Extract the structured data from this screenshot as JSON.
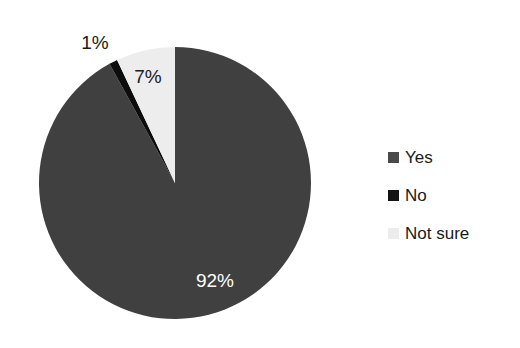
{
  "chart_data": {
    "type": "pie",
    "title": "",
    "subtitle": "",
    "xlabel": "",
    "ylabel": "",
    "categories": [
      "Yes",
      "No",
      "Not sure"
    ],
    "values": [
      92,
      1,
      7
    ],
    "value_unit": "%",
    "data_labels": [
      "92%",
      "1%",
      "7%"
    ],
    "colors": [
      "#404040",
      "#0d0d0d",
      "#ededed"
    ],
    "legend_position": "right",
    "grid": false,
    "start_angle_deg": 0,
    "direction": "clockwise",
    "background": "#ffffff",
    "slices": [
      {
        "name": "Yes",
        "value": 92,
        "label": "92%",
        "color": "#404040",
        "label_color": "#ffffff",
        "label_placement": "inside"
      },
      {
        "name": "No",
        "value": 1,
        "label": "1%",
        "color": "#0d0d0d",
        "label_color": "#1a1a1a",
        "label_placement": "outside"
      },
      {
        "name": "Not sure",
        "value": 7,
        "label": "7%",
        "color": "#ededed",
        "label_color": "#202020",
        "label_placement": "inside"
      }
    ]
  },
  "legend": {
    "items": [
      {
        "label": "Yes",
        "color": "#4a4a4a"
      },
      {
        "label": "No",
        "color": "#141414"
      },
      {
        "label": "Not sure",
        "color": "#ececec"
      }
    ]
  },
  "labels": {
    "yes_pct": "92%",
    "no_pct": "1%",
    "not_sure_pct": "7%"
  }
}
